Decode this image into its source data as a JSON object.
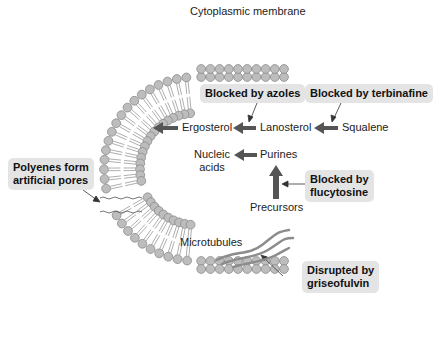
{
  "diagram": {
    "title": "Cytoplasmic membrane",
    "pathway": {
      "ergosterol": "Ergosterol",
      "lanosterol": "Lanosterol",
      "squalene": "Squalene",
      "nucleic_acids_line1": "Nucleic",
      "nucleic_acids_line2": "acids",
      "purines": "Purines",
      "precursors": "Precursors",
      "microtubules": "Microtubules"
    },
    "drug_boxes": {
      "azoles": "Blocked by azoles",
      "terbinafine": "Blocked by terbinafine",
      "flucytosine_line1": "Blocked by",
      "flucytosine_line2": "flucytosine",
      "polyenes_line1": "Polyenes form",
      "polyenes_line2": "artificial pores",
      "griseofulvin_line1": "Disrupted by",
      "griseofulvin_line2": "griseofulvin"
    },
    "colors": {
      "lipid_head_fill": "#bdbdbd",
      "lipid_head_stroke": "#8a8a8a",
      "arrow_fill": "#555555",
      "box_fill": "#e4e4e4",
      "microtubule": "#8c8c8c"
    }
  }
}
